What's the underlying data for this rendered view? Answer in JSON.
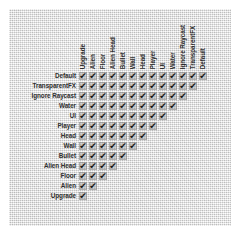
{
  "panel": {
    "title": "Layer Collision Matrix",
    "background_color": "#e8e8e8",
    "check_glyph": "✔",
    "label_color": "#2b2b2b",
    "cell_color": "#aaaaaa"
  },
  "matrix": {
    "row_labels": [
      "Default",
      "TransparentFX",
      "Ignore Raycast",
      "Water",
      "UI",
      "Player",
      "Head",
      "Wall",
      "Bullet",
      "Alien Head",
      "Floor",
      "Alien",
      "Upgrade"
    ],
    "column_labels": [
      "Upgrade",
      "Alien",
      "Floor",
      "Alien Head",
      "Bullet",
      "Wall",
      "Head",
      "Player",
      "UI",
      "Water",
      "Ignore Raycast",
      "TransparentFX",
      "Default"
    ],
    "checked": [
      [
        true,
        true,
        true,
        true,
        true,
        true,
        true,
        true,
        true,
        true,
        true,
        true,
        true
      ],
      [
        true,
        true,
        true,
        true,
        true,
        true,
        true,
        true,
        true,
        true,
        true,
        true,
        false
      ],
      [
        true,
        true,
        true,
        true,
        true,
        true,
        true,
        true,
        true,
        true,
        true,
        false,
        false
      ],
      [
        true,
        true,
        true,
        true,
        true,
        true,
        true,
        true,
        true,
        true,
        false,
        false,
        false
      ],
      [
        true,
        true,
        true,
        true,
        true,
        true,
        true,
        true,
        true,
        false,
        false,
        false,
        false
      ],
      [
        true,
        true,
        true,
        true,
        true,
        true,
        true,
        true,
        false,
        false,
        false,
        false,
        false
      ],
      [
        true,
        true,
        true,
        true,
        true,
        true,
        true,
        false,
        false,
        false,
        false,
        false,
        false
      ],
      [
        true,
        true,
        true,
        true,
        true,
        true,
        false,
        false,
        false,
        false,
        false,
        false,
        false
      ],
      [
        true,
        true,
        true,
        true,
        true,
        false,
        false,
        false,
        false,
        false,
        false,
        false,
        false
      ],
      [
        true,
        true,
        true,
        true,
        false,
        false,
        false,
        false,
        false,
        false,
        false,
        false,
        false
      ],
      [
        true,
        true,
        true,
        false,
        false,
        false,
        false,
        false,
        false,
        false,
        false,
        false,
        false
      ],
      [
        true,
        true,
        false,
        false,
        false,
        false,
        false,
        false,
        false,
        false,
        false,
        false,
        false
      ],
      [
        true,
        false,
        false,
        false,
        false,
        false,
        false,
        false,
        false,
        false,
        false,
        false,
        false
      ]
    ]
  }
}
